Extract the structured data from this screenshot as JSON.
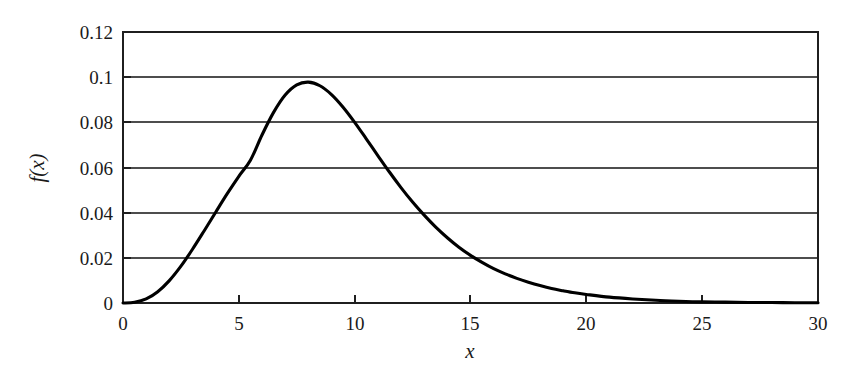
{
  "chart_data": {
    "type": "line",
    "title": "",
    "subtitle": "",
    "xlabel": "x",
    "ylabel": "f(x)",
    "xlim": [
      0,
      30
    ],
    "ylim": [
      0,
      0.12
    ],
    "grid": "horizontal",
    "legend": "none",
    "x_ticks": [
      0,
      5,
      10,
      15,
      20,
      25,
      30
    ],
    "x_tick_labels": [
      "0",
      "5",
      "10",
      "15",
      "20",
      "25",
      "30"
    ],
    "y_ticks": [
      0,
      0.02,
      0.04,
      0.06,
      0.08,
      0.1,
      0.12
    ],
    "y_tick_labels": [
      "0",
      "0.02",
      "0.04",
      "0.06",
      "0.08",
      "0.1",
      "0.12"
    ],
    "series": [
      {
        "name": "f(x)",
        "color": "#000000",
        "x": [
          0.0,
          0.5,
          1.0,
          1.5,
          2.0,
          2.5,
          3.0,
          3.5,
          4.0,
          4.5,
          5.0,
          5.5,
          6.0,
          6.5,
          7.0,
          7.5,
          8.0,
          8.5,
          9.0,
          9.5,
          10.0,
          10.5,
          11.0,
          11.5,
          12.0,
          12.5,
          13.0,
          13.5,
          14.0,
          14.5,
          15.0,
          15.5,
          16.0,
          16.5,
          17.0,
          17.5,
          18.0,
          18.5,
          19.0,
          19.5,
          20.0,
          21.0,
          22.0,
          23.0,
          24.0,
          25.0,
          26.0,
          27.0,
          28.0,
          29.0,
          30.0
        ],
        "y": [
          0.0,
          0.0003,
          0.0018,
          0.005,
          0.0099,
          0.0163,
          0.0238,
          0.0319,
          0.0402,
          0.0484,
          0.0561,
          0.0632,
          0.0744,
          0.0844,
          0.0921,
          0.0966,
          0.0978,
          0.0962,
          0.0923,
          0.0867,
          0.08,
          0.0727,
          0.0653,
          0.058,
          0.0511,
          0.0447,
          0.0389,
          0.0336,
          0.0289,
          0.0247,
          0.0211,
          0.018,
          0.0152,
          0.0129,
          0.0109,
          0.0092,
          0.0077,
          0.0064,
          0.0054,
          0.0045,
          0.0038,
          0.0026,
          0.0018,
          0.0012,
          0.0008,
          0.0005,
          0.0004,
          0.0002,
          0.0002,
          0.0001,
          0.0001
        ]
      }
    ],
    "annotations": {
      "peak_x": 7.9,
      "peak_y": 0.098
    }
  },
  "axes": {
    "y_axis_title": "f(x)",
    "x_axis_title": "x"
  }
}
